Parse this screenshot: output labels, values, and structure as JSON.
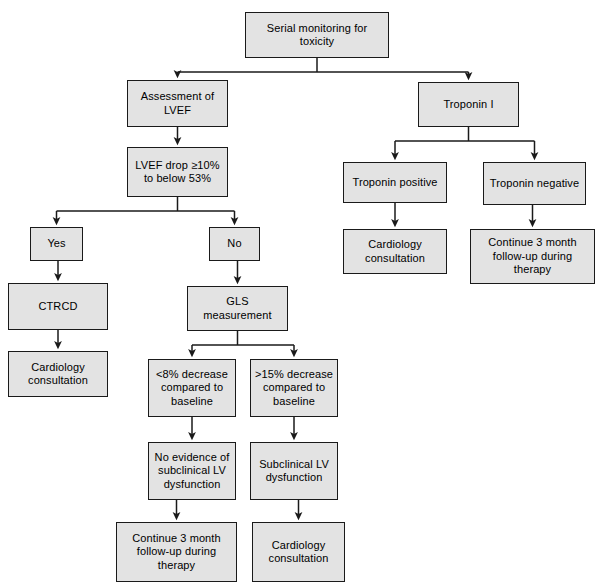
{
  "diagram": {
    "colors": {
      "node_fill": "#e3e3e3",
      "node_border": "#1a1a1a",
      "connector": "#1a1a1a",
      "background": "#ffffff"
    },
    "nodes": [
      {
        "id": "root",
        "label": "Serial monitoring for toxicity",
        "x": 245,
        "y": 12,
        "w": 144,
        "h": 46
      },
      {
        "id": "lvef_assess",
        "label": "Assessment of\nLVEF",
        "x": 127,
        "y": 80,
        "w": 101,
        "h": 47
      },
      {
        "id": "troponin",
        "label": "Troponin I",
        "x": 418,
        "y": 82,
        "w": 101,
        "h": 45
      },
      {
        "id": "lvef_drop",
        "label": "LVEF drop ≥10%\nto below 53%",
        "x": 127,
        "y": 147,
        "w": 101,
        "h": 50
      },
      {
        "id": "trop_pos",
        "label": "Troponin positive",
        "x": 343,
        "y": 162,
        "w": 104,
        "h": 41
      },
      {
        "id": "trop_neg",
        "label": "Troponin negative",
        "x": 483,
        "y": 162,
        "w": 103,
        "h": 43
      },
      {
        "id": "yes",
        "label": "Yes",
        "x": 30,
        "y": 227,
        "w": 53,
        "h": 34
      },
      {
        "id": "no",
        "label": "No",
        "x": 209,
        "y": 227,
        "w": 51,
        "h": 34
      },
      {
        "id": "trop_pos_card",
        "label": "Cardiology\nconsultation",
        "x": 343,
        "y": 229,
        "w": 104,
        "h": 45
      },
      {
        "id": "trop_neg_cont",
        "label": "Continue 3 month\nfollow-up during therapy",
        "x": 470,
        "y": 229,
        "w": 125,
        "h": 55
      },
      {
        "id": "ctrcd",
        "label": "CTRCD",
        "x": 8,
        "y": 283,
        "w": 100,
        "h": 47
      },
      {
        "id": "gls",
        "label": "GLS measurement",
        "x": 187,
        "y": 286,
        "w": 101,
        "h": 45
      },
      {
        "id": "ctrcd_card",
        "label": "Cardiology\nconsultation",
        "x": 8,
        "y": 351,
        "w": 100,
        "h": 46
      },
      {
        "id": "gls_low",
        "label": "<8% decrease\ncompared to\nbaseline",
        "x": 148,
        "y": 359,
        "w": 88,
        "h": 58
      },
      {
        "id": "gls_high",
        "label": ">15% decrease\ncompared to\nbaseline",
        "x": 250,
        "y": 359,
        "w": 88,
        "h": 58
      },
      {
        "id": "no_subclin",
        "label": "No evidence of\nsubclinical LV\ndysfunction",
        "x": 148,
        "y": 442,
        "w": 88,
        "h": 58
      },
      {
        "id": "subclin",
        "label": "Subclinical LV\ndysfunction",
        "x": 250,
        "y": 442,
        "w": 88,
        "h": 58
      },
      {
        "id": "gls_low_cont",
        "label": "Continue 3 month\nfollow-up during therapy",
        "x": 116,
        "y": 522,
        "w": 121,
        "h": 60
      },
      {
        "id": "gls_high_card",
        "label": "Cardiology\nconsultation",
        "x": 252,
        "y": 522,
        "w": 93,
        "h": 60
      }
    ],
    "connectors": [
      {
        "id": "root-to-lvef",
        "from": "root",
        "to": "lvef_assess",
        "kind": "split",
        "path": "M317,58 L317,72 M151,72 L492,72 M177.5,72 L177.5,74"
      },
      {
        "id": "root-to-troponin",
        "from": "root",
        "to": "troponin",
        "kind": "split",
        "path": ""
      },
      {
        "id": "lvef-to-drop",
        "from": "lvef_assess",
        "to": "lvef_drop",
        "kind": "straight",
        "path": ""
      },
      {
        "id": "drop-to-yes",
        "from": "lvef_drop",
        "to": "yes",
        "kind": "split",
        "path": ""
      },
      {
        "id": "drop-to-no",
        "from": "lvef_drop",
        "to": "no",
        "kind": "split",
        "path": ""
      },
      {
        "id": "yes-to-ctrcd",
        "from": "yes",
        "to": "ctrcd",
        "kind": "straight",
        "path": ""
      },
      {
        "id": "ctrcd-to-card",
        "from": "ctrcd",
        "to": "ctrcd_card",
        "kind": "straight",
        "path": ""
      },
      {
        "id": "no-to-gls",
        "from": "no",
        "to": "gls",
        "kind": "straight",
        "path": ""
      },
      {
        "id": "gls-to-low",
        "from": "gls",
        "to": "gls_low",
        "kind": "split",
        "path": ""
      },
      {
        "id": "gls-to-high",
        "from": "gls",
        "to": "gls_high",
        "kind": "split",
        "path": ""
      },
      {
        "id": "low-to-nosubclin",
        "from": "gls_low",
        "to": "no_subclin",
        "kind": "straight",
        "path": ""
      },
      {
        "id": "high-to-subclin",
        "from": "gls_high",
        "to": "subclin",
        "kind": "straight",
        "path": ""
      },
      {
        "id": "nosubclin-to-cont",
        "from": "no_subclin",
        "to": "gls_low_cont",
        "kind": "straight",
        "path": ""
      },
      {
        "id": "subclin-to-card",
        "from": "subclin",
        "to": "gls_high_card",
        "kind": "straight",
        "path": ""
      },
      {
        "id": "troponin-to-pos",
        "from": "troponin",
        "to": "trop_pos",
        "kind": "split",
        "path": ""
      },
      {
        "id": "troponin-to-neg",
        "from": "troponin",
        "to": "trop_neg",
        "kind": "split",
        "path": ""
      },
      {
        "id": "pos-to-card",
        "from": "trop_pos",
        "to": "trop_pos_card",
        "kind": "straight",
        "path": ""
      },
      {
        "id": "neg-to-cont",
        "from": "trop_neg",
        "to": "trop_neg_cont",
        "kind": "straight",
        "path": ""
      }
    ]
  }
}
